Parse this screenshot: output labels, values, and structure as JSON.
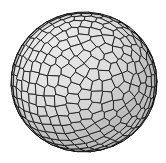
{
  "image": {
    "title": "Tessellated sphere",
    "subject": "sphere-with-polygonal-cells",
    "width": 166,
    "height": 163,
    "background_color": "#ffffff"
  },
  "sphere": {
    "center_x": 84,
    "center_y": 82,
    "radius_x": 73,
    "radius_y": 70,
    "cell_fill_color": "#dedede",
    "cell_fill_highlight": "#e8e8e8",
    "cell_fill_shadow": "#bdbdbd",
    "cell_stroke_color": "#1c1c1c",
    "cell_stroke_width": 0.9,
    "rim_stroke_color": "#111111",
    "cell_count": 520,
    "cells_across_equator": 17,
    "cell_shape": "irregular-polygon-voronoi",
    "light_direction": "upper-left",
    "seed": 20240517
  }
}
